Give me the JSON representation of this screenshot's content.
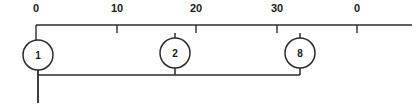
{
  "diagram": {
    "type": "number-line-node-diagram",
    "canvas": {
      "width": 417,
      "height": 106,
      "background": "#ffffff"
    },
    "ink_color": "#2b2b2b",
    "text_color": "#1b1b1b",
    "axis": {
      "name": "horizontal-scale-axis",
      "y": 25,
      "x_start": 36,
      "x_end": 412,
      "tick_length": 8,
      "value_min": 0,
      "value_max": 40,
      "pixels_per_unit": 8.03,
      "ticks": [
        {
          "label": "0",
          "value": 0,
          "x": 36,
          "label_x": 36,
          "label_y": 12
        },
        {
          "label": "10",
          "value": 10,
          "x": 117,
          "label_x": 117,
          "label_y": 12
        },
        {
          "label": "20",
          "value": 20,
          "x": 196,
          "label_x": 196,
          "label_y": 12
        },
        {
          "label": "30",
          "value": 30,
          "x": 277,
          "label_x": 277,
          "label_y": 12
        },
        {
          "label": "0",
          "value": 40,
          "x": 357,
          "label_x": 357,
          "label_y": 12
        }
      ]
    },
    "nodes": [
      {
        "id": "node-1",
        "label": "1",
        "cx": 38,
        "cy": 55,
        "r": 15,
        "axis_value": 0,
        "top_stem": true,
        "bottom_stem": true
      },
      {
        "id": "node-2",
        "label": "2",
        "cx": 175,
        "cy": 53,
        "r": 15,
        "axis_value": 17.3,
        "top_stem": false,
        "bottom_stem": true
      },
      {
        "id": "node-8",
        "label": "8",
        "cx": 300,
        "cy": 53,
        "r": 15,
        "axis_value": 32.9,
        "top_stem": false,
        "bottom_stem": true
      }
    ],
    "bus": {
      "name": "lower-connector-bus",
      "y": 75,
      "x_start": 38,
      "x_end": 300
    },
    "drop": {
      "name": "left-vertical-drop-line",
      "x": 38,
      "y_start": 68,
      "y_end": 103
    }
  }
}
